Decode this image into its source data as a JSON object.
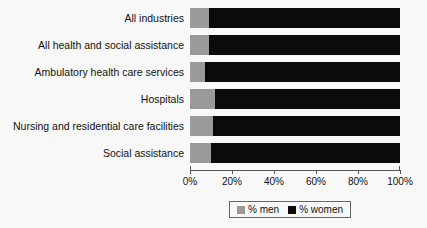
{
  "chart_data": {
    "type": "bar",
    "subtype": "stacked-horizontal-100-percent",
    "title": "",
    "xlabel": "",
    "ylabel": "",
    "xlim": [
      0,
      100
    ],
    "grid": false,
    "legend_position": "bottom-center",
    "categories": [
      "All industries",
      "All health and social assistance",
      "Ambulatory health care services",
      "Hospitals",
      "Nursing and residential care facilities",
      "Social assistance"
    ],
    "series": [
      {
        "name": "% men",
        "color": "#9a9a9a",
        "values": [
          9,
          9,
          7,
          12,
          11,
          10
        ]
      },
      {
        "name": "% women",
        "color": "#0b0b0b",
        "values": [
          91,
          91,
          93,
          88,
          89,
          90
        ]
      }
    ],
    "tick_labels": [
      "0%",
      "20%",
      "40%",
      "60%",
      "80%",
      "100%"
    ],
    "tick_values": [
      0,
      20,
      40,
      60,
      80,
      100
    ]
  },
  "legend": {
    "items": [
      {
        "label": "% men",
        "color": "#9a9a9a"
      },
      {
        "label": "% women",
        "color": "#0b0b0b"
      }
    ]
  },
  "colors": {
    "men": "#9a9a9a",
    "women": "#0b0b0b",
    "background": "#f8f8f8",
    "axis": "#555555",
    "text": "#111111"
  }
}
